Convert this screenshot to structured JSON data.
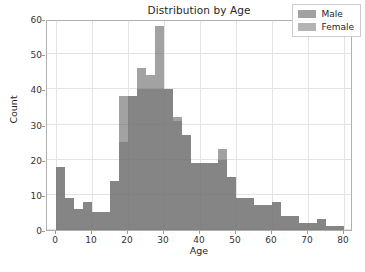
{
  "chart_data": {
    "type": "bar",
    "title": "Distribution by Age",
    "xlabel": "Age",
    "ylabel": "Count",
    "xlim": [
      -2.5,
      82.5
    ],
    "ylim": [
      0,
      60
    ],
    "xticks": [
      0,
      10,
      20,
      30,
      40,
      50,
      60,
      70,
      80
    ],
    "yticks": [
      0,
      10,
      20,
      30,
      40,
      50,
      60
    ],
    "grid": true,
    "legend_position": "upper right",
    "bin_width": 2.5,
    "bin_starts": [
      0,
      2.5,
      5,
      7.5,
      10,
      12.5,
      15,
      17.5,
      20,
      22.5,
      25,
      27.5,
      30,
      32.5,
      35,
      37.5,
      40,
      42.5,
      45,
      47.5,
      50,
      52.5,
      55,
      57.5,
      60,
      62.5,
      65,
      67.5,
      70,
      72.5,
      75,
      77.5
    ],
    "series": [
      {
        "name": "Male",
        "color": "#696969",
        "values": [
          18,
          9,
          6,
          8,
          5,
          5,
          14,
          38,
          38,
          46,
          44,
          58,
          40,
          32,
          27,
          19,
          19,
          19,
          23,
          15,
          9,
          9,
          7,
          7,
          8,
          4,
          4,
          2,
          2,
          3,
          1,
          1
        ]
      },
      {
        "name": "Female",
        "color": "#828282",
        "values": [
          18,
          9,
          6,
          8,
          5,
          5,
          14,
          25,
          38,
          40,
          40,
          40,
          40,
          31,
          27,
          19,
          19,
          19,
          20,
          15,
          9,
          9,
          7,
          7,
          8,
          4,
          4,
          2,
          2,
          3,
          1,
          1
        ]
      }
    ]
  },
  "legend": {
    "items": [
      {
        "label": "Male"
      },
      {
        "label": "Female"
      }
    ]
  }
}
